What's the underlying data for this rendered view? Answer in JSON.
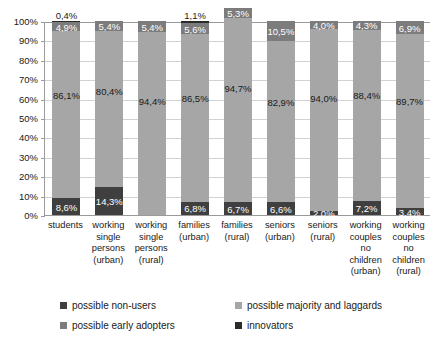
{
  "chart_data": {
    "type": "bar",
    "subtype": "stacked-100-percent",
    "title": "",
    "xlabel": "",
    "ylabel": "",
    "ylim": [
      0,
      100
    ],
    "ytick_labels": [
      "100%",
      "90%",
      "80%",
      "70%",
      "60%",
      "50%",
      "40%",
      "30%",
      "20%",
      "10%",
      "0%"
    ],
    "ytick_values": [
      100,
      90,
      80,
      70,
      60,
      50,
      40,
      30,
      20,
      10,
      0
    ],
    "grid": true,
    "legend_position": "bottom",
    "categories": [
      "students",
      "working single persons (urban)",
      "working single persons (rural)",
      "families (urban)",
      "families (rural)",
      "seniors (urban)",
      "seniors (rural)",
      "working couples no children (urban)",
      "working couples no children (rural)"
    ],
    "category_lines": [
      [
        "students"
      ],
      [
        "working",
        "single",
        "persons",
        "(urban)"
      ],
      [
        "working",
        "single",
        "persons",
        "(rural)"
      ],
      [
        "families",
        "(urban)"
      ],
      [
        "families",
        "(rural)"
      ],
      [
        "seniors",
        "(urban)"
      ],
      [
        "seniors",
        "(rural)"
      ],
      [
        "working",
        "couples",
        "no",
        "children",
        "(urban)"
      ],
      [
        "working",
        "couples",
        "no",
        "children",
        "(rural)"
      ]
    ],
    "series": [
      {
        "name": "possible non-users",
        "color": "#3f3f3f",
        "values": [
          8.6,
          14.3,
          0.0,
          6.8,
          6.7,
          6.6,
          2.0,
          7.2,
          3.4
        ],
        "labels": [
          "8,6%",
          "14,3%",
          "",
          "6,8%",
          "6,7%",
          "6,6%",
          "2,0%",
          "7,2%",
          "3,4%"
        ]
      },
      {
        "name": "possible majority and laggards",
        "color": "#a6a6a6",
        "values": [
          86.1,
          80.4,
          94.4,
          86.5,
          94.7,
          82.9,
          94.0,
          88.4,
          89.7
        ],
        "labels": [
          "86,1%",
          "80,4%",
          "94,4%",
          "86,5%",
          "94,7%",
          "82,9%",
          "94,0%",
          "88,4%",
          "89,7%"
        ]
      },
      {
        "name": "possible early adopters",
        "color": "#7c7c7c",
        "values": [
          4.9,
          5.4,
          5.4,
          5.6,
          5.3,
          10.5,
          4.0,
          4.3,
          6.9
        ],
        "labels": [
          "4,9%",
          "5,4%",
          "5,4%",
          "5,6%",
          "5,3%",
          "10,5%",
          "4,0%",
          "4,3%",
          "6,9%"
        ]
      },
      {
        "name": "innovators",
        "color": "#2b2b2b",
        "values": [
          0.4,
          0.0,
          0.0,
          1.1,
          0.0,
          0.0,
          0.0,
          0.0,
          0.0
        ],
        "labels": [
          "0,4%",
          "",
          "",
          "1,1%",
          "",
          "",
          "",
          "",
          ""
        ]
      }
    ]
  },
  "legend": {
    "items": [
      {
        "label": "possible non-users",
        "swatch": "sw-nonusers"
      },
      {
        "label": "possible majority and laggards",
        "swatch": "sw-majority"
      },
      {
        "label": "possible early adopters",
        "swatch": "sw-early"
      },
      {
        "label": "innovators",
        "swatch": "sw-innov"
      }
    ]
  }
}
